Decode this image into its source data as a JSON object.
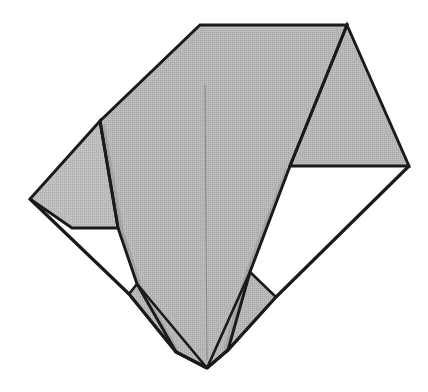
{
  "figure": {
    "canvas": {
      "width": 428,
      "height": 392
    },
    "colors": {
      "background": "#ffffff",
      "panel_gray": "#b4b4b4",
      "panel_gray_light": "#bdbdbd",
      "panel_gray_dark": "#a9a9a9",
      "shadow_gray": "#9a9a9a",
      "outline": "#1a1a1a",
      "crease": "#8a8a8a"
    },
    "stroke_widths": {
      "outline": 3.2,
      "inner_edge": 2.6,
      "crease": 1.1
    },
    "vertices": {
      "top_left_apex": [
        200,
        25
      ],
      "top_right_apex": [
        347,
        25
      ],
      "right_point": [
        409,
        166
      ],
      "right_wing_inner": [
        290,
        166
      ],
      "left_upper_bend": [
        100,
        121
      ],
      "left_point": [
        30,
        199
      ],
      "left_notch_corner": [
        72,
        228
      ],
      "bottom_apex": [
        207,
        368
      ],
      "left_flap_top": [
        137,
        284
      ],
      "left_flap_left": [
        129,
        294
      ],
      "left_flap_bottom": [
        176,
        352
      ],
      "right_flap_top": [
        250,
        272
      ],
      "right_flap_right": [
        276,
        297
      ],
      "right_flap_bottom": [
        228,
        350
      ],
      "left_wing_inner_tip": [
        118,
        228
      ],
      "center_crease_top": [
        205,
        85
      ],
      "center_crease_bottom": [
        207,
        360
      ]
    },
    "panels": [
      {
        "name": "main-body",
        "shade": "panel_gray"
      },
      {
        "name": "right-wing",
        "shade": "panel_gray"
      },
      {
        "name": "left-wing",
        "shade": "panel_gray_light"
      },
      {
        "name": "left-bottom-flap",
        "shade": "panel_gray"
      },
      {
        "name": "right-bottom-flap",
        "shade": "panel_gray"
      }
    ],
    "openings": [
      {
        "name": "left-notch-opening",
        "fill": "background"
      },
      {
        "name": "right-notch-opening",
        "fill": "background"
      }
    ],
    "paths": {
      "main_body": "M 200,25 L 347,25 L 290,166 L 250,272 L 228,350 L 207,368 L 176,352 L 137,284 L 118,228 L 100,121 Z",
      "right_wing": "M 347,25 L 409,166 L 290,166 Z",
      "left_wing": "M 100,121 L 30,199 L 72,228 L 118,228 Z",
      "left_bottom_flap": "M 137,284 L 129,294 L 176,352 L 207,368 Z",
      "right_bottom_flap": "M 250,272 L 276,297 L 228,350 L 207,368 Z",
      "left_opening": "M 72,228 L 118,228 L 137,284 L 129,294 Z",
      "right_opening": "M 290,166 L 409,166 L 276,297 L 250,272 Z",
      "outer_left_edge": "M 30,199 L 129,294",
      "outer_left_lower": "M 129,294 L 176,352 L 207,368",
      "outer_right_edge": "M 409,166 L 276,297",
      "outer_right_lower": "M 276,297 L 228,350 L 207,368",
      "center_crease": "M 205,85 L 207,360"
    }
  }
}
